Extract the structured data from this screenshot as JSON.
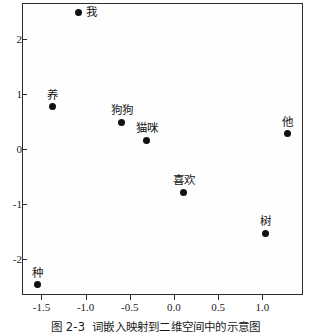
{
  "caption": {
    "number": "图 2-3",
    "text": "词嵌入映射到二维空间中的示意图"
  },
  "chart_data": {
    "type": "scatter",
    "title": "",
    "subtitle": "",
    "xlabel": "",
    "ylabel": "",
    "xlim": [
      -1.72,
      1.46
    ],
    "ylim": [
      -2.66,
      2.65
    ],
    "xticks": [
      -1.5,
      -1.0,
      -0.5,
      0.0,
      0.5,
      1.0
    ],
    "yticks": [
      2,
      1,
      0,
      -1,
      -2
    ],
    "xticklabels": [
      "-1.5",
      "-1.0",
      "-0.5",
      "0.0",
      "0.5",
      "1.0"
    ],
    "yticklabels": [
      "2",
      "1",
      "0",
      "-1",
      "-2"
    ],
    "grid": false,
    "legend": false,
    "marker_color": "#111111",
    "frame_color": "#2b2b2b",
    "points": [
      {
        "label": "我",
        "x": -1.08,
        "y": 2.47,
        "label_pos": "right"
      },
      {
        "label": "养",
        "x": -1.38,
        "y": 0.76,
        "label_pos": "above"
      },
      {
        "label": "狗狗",
        "x": -0.59,
        "y": 0.48,
        "label_pos": "above"
      },
      {
        "label": "猫咪",
        "x": -0.31,
        "y": 0.15,
        "label_pos": "above"
      },
      {
        "label": "他",
        "x": 1.28,
        "y": 0.27,
        "label_pos": "above"
      },
      {
        "label": "喜欢",
        "x": 0.11,
        "y": -0.79,
        "label_pos": "above"
      },
      {
        "label": "树",
        "x": 1.03,
        "y": -1.54,
        "label_pos": "above"
      },
      {
        "label": "种",
        "x": -1.54,
        "y": -2.47,
        "label_pos": "above"
      }
    ]
  }
}
